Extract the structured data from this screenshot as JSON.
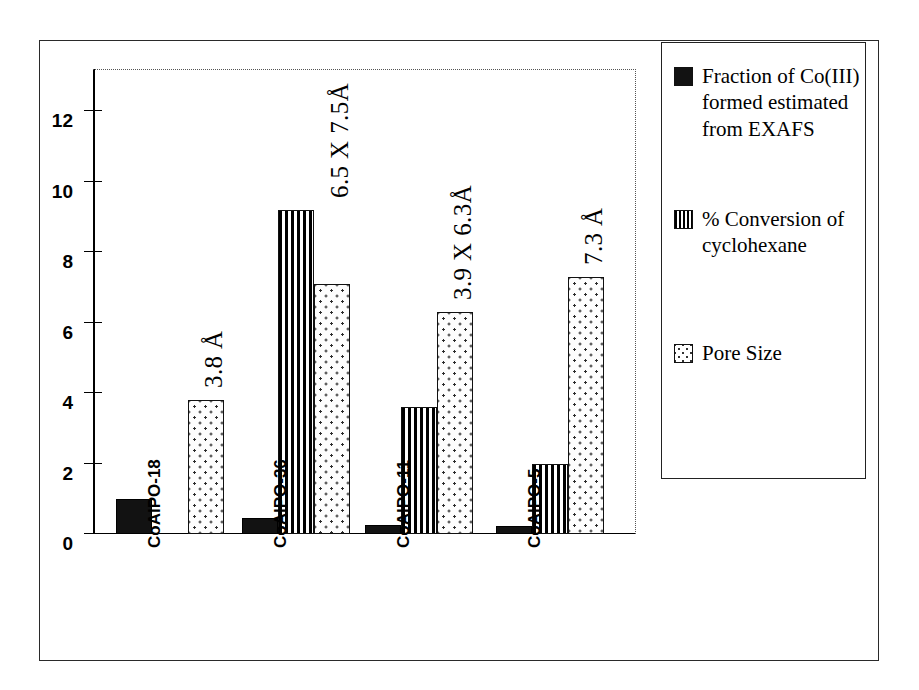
{
  "chart_data": {
    "type": "bar",
    "title": "",
    "xlabel": "",
    "ylabel": "",
    "ylim": [
      0,
      13.2
    ],
    "yticks": [
      0,
      2,
      4,
      6,
      8,
      10,
      12
    ],
    "ytick_labels": [
      "0",
      "2",
      "4",
      "6",
      "8",
      "10",
      "12"
    ],
    "grid": "top-and-right dotted border only",
    "legend_position": "right outside",
    "categories": [
      "CoAlPO-18",
      "CoAlPO-36",
      "CoAlPO-11",
      "CoAlPO-5"
    ],
    "series": [
      {
        "name": "Fraction of Co(III) formed estimated from EXAFS",
        "pattern": "solid-black",
        "values": [
          1.0,
          0.45,
          0.25,
          0.22
        ]
      },
      {
        "name": "% Conversion of cyclohexane",
        "pattern": "vertical-stripes",
        "values": [
          null,
          9.2,
          3.6,
          2.0
        ]
      },
      {
        "name": "Pore Size",
        "pattern": "dots",
        "values": [
          3.8,
          7.1,
          6.3,
          7.3
        ]
      }
    ],
    "annotations": [
      {
        "category": "CoAlPO-18",
        "text": "3.8 Å"
      },
      {
        "category": "CoAlPO-36",
        "text": "6.5 X 7.5Å"
      },
      {
        "category": "CoAlPO-11",
        "text": "3.9 X 6.3Å"
      },
      {
        "category": "CoAlPO-5",
        "text": "7.3 Å"
      }
    ]
  },
  "legend": {
    "items": [
      {
        "label": "Fraction of Co(III) formed estimated from EXAFS",
        "pattern": "solid"
      },
      {
        "label": "% Conversion of cyclohexane",
        "pattern": "striped"
      },
      {
        "label": "Pore Size",
        "pattern": "dotted"
      }
    ]
  },
  "colors": {
    "series_solid": "#121212",
    "series_striped": "#000000",
    "series_dotted": "#2b2b2b",
    "axis": "#000000",
    "frame": "#2a2a2a",
    "background": "#ffffff"
  }
}
